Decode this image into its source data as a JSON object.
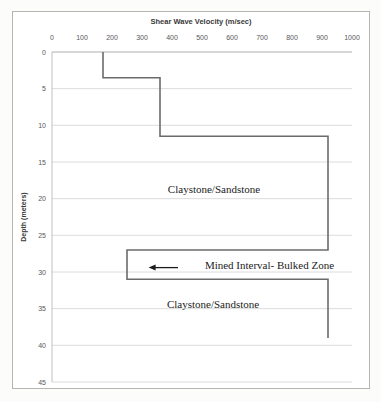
{
  "chart": {
    "border_color": "#b5b5b5",
    "background": "#ffffff"
  },
  "chart_data": {
    "type": "line",
    "subtype": "step-profile",
    "title": "Shear Wave Velocity (m/sec)",
    "xlabel": "Shear Wave Velocity (m/sec)",
    "ylabel": "Depth (meters)",
    "x_axis": {
      "position": "top",
      "min": 0,
      "max": 1000,
      "ticks": [
        0,
        100,
        200,
        300,
        400,
        500,
        600,
        700,
        800,
        900,
        1000
      ]
    },
    "y_axis": {
      "position": "left",
      "min": 0,
      "max": 45,
      "inverted": true,
      "ticks": [
        0,
        5,
        10,
        15,
        20,
        25,
        30,
        35,
        40,
        45
      ]
    },
    "grid": true,
    "legend": "none",
    "series": [
      {
        "name": "shear-wave-velocity-profile",
        "color": "#6b6b6b",
        "points": [
          {
            "depth": 0,
            "velocity": 170
          },
          {
            "depth": 3.5,
            "velocity": 170
          },
          {
            "depth": 3.5,
            "velocity": 360
          },
          {
            "depth": 11.5,
            "velocity": 360
          },
          {
            "depth": 11.5,
            "velocity": 920
          },
          {
            "depth": 27,
            "velocity": 920
          },
          {
            "depth": 27,
            "velocity": 250
          },
          {
            "depth": 31,
            "velocity": 250
          },
          {
            "depth": 31,
            "velocity": 920
          },
          {
            "depth": 39,
            "velocity": 920
          }
        ]
      }
    ],
    "annotations": [
      {
        "text": "Claystone/Sandstone",
        "velocity": 540,
        "depth": 18.7
      },
      {
        "text": "Mined Interval- Bulked Zone",
        "velocity": 725,
        "depth": 29.1
      },
      {
        "text": "Claystone/Sandstone",
        "velocity": 537,
        "depth": 34.4
      }
    ],
    "arrow": {
      "from_velocity": 420,
      "to_velocity": 322,
      "depth": 29.4,
      "direction": "left"
    },
    "colors": {
      "line": "#6b6b6b",
      "grid": "#dcdcdc",
      "axis": "#c0c0c0",
      "tick_text": "#595959",
      "title_text": "#3a3a3a",
      "annotation_text": "#1c1c1c",
      "arrow": "#1c1c1c"
    }
  }
}
